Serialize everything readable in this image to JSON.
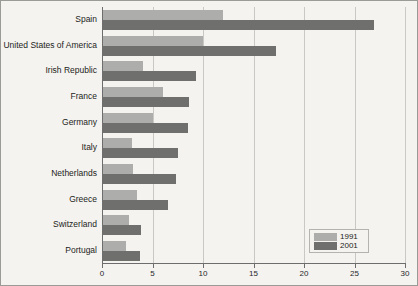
{
  "chart_data": {
    "type": "bar",
    "orientation": "horizontal",
    "title": "",
    "subtitle": "",
    "xlabel": "",
    "ylabel": "",
    "xlim": [
      0,
      30
    ],
    "xticks": [
      "0",
      "5",
      "10",
      "15",
      "20",
      "25",
      "30"
    ],
    "grid": true,
    "legend_position": "bottom-right",
    "categories": [
      "Spain",
      "United States of America",
      "Irish Republic",
      "France",
      "Germany",
      "Italy",
      "Netherlands",
      "Greece",
      "Switzerland",
      "Portugal"
    ],
    "series": [
      {
        "name": "1991",
        "color": "#adadab",
        "values": [
          12.0,
          10.0,
          4.1,
          6.0,
          5.0,
          3.0,
          3.1,
          3.5,
          2.7,
          2.4
        ]
      },
      {
        "name": "2001",
        "color": "#6f6f6d",
        "values": [
          26.9,
          17.2,
          9.3,
          8.6,
          8.5,
          7.5,
          7.3,
          6.5,
          3.9,
          3.8
        ]
      }
    ]
  },
  "legend": {
    "entries": [
      {
        "label": "1991",
        "color": "#adadab"
      },
      {
        "label": "2001",
        "color": "#6f6f6d"
      }
    ]
  }
}
